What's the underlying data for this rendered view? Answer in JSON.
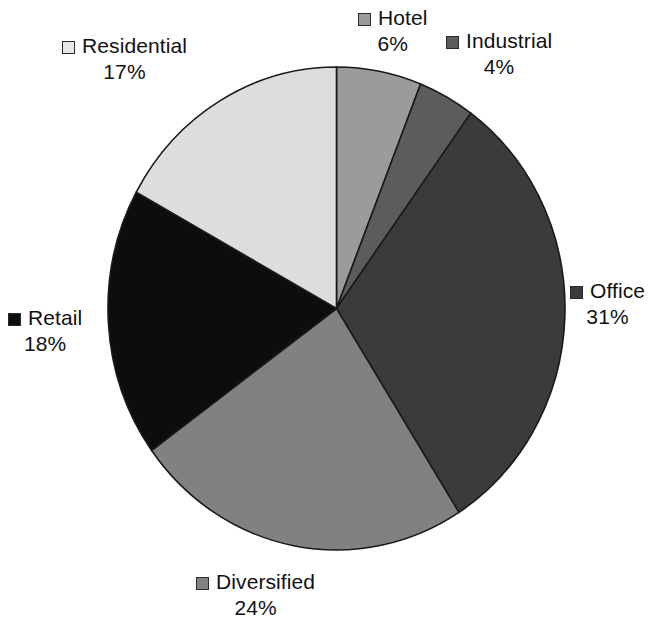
{
  "chart_data": {
    "type": "pie",
    "title": "",
    "subtitle": "",
    "xlabel": "",
    "ylabel": "",
    "grid": false,
    "legend_position": "callouts-around-pie",
    "label_format": "name + percent",
    "start_angle_deg": 0,
    "direction": "clockwise",
    "categories": [
      "Hotel",
      "Industrial",
      "Office",
      "Diversified",
      "Retail",
      "Residential"
    ],
    "values": [
      6,
      4,
      31,
      24,
      18,
      17
    ],
    "units": "percent",
    "total": 100,
    "slices": [
      {
        "name": "Hotel",
        "value": 6,
        "label": "Hotel",
        "percent_text": "6%",
        "color": "#9b9b9b",
        "swatch_color": "#9b9b9b"
      },
      {
        "name": "Industrial",
        "value": 4,
        "label": "Industrial",
        "percent_text": "4%",
        "color": "#5c5c5c",
        "swatch_color": "#5c5c5c"
      },
      {
        "name": "Office",
        "value": 31,
        "label": "Office",
        "percent_text": "31%",
        "color": "#3b3b3b",
        "swatch_color": "#3b3b3b"
      },
      {
        "name": "Diversified",
        "value": 24,
        "label": "Diversified",
        "percent_text": "24%",
        "color": "#818181",
        "swatch_color": "#818181"
      },
      {
        "name": "Retail",
        "value": 18,
        "label": "Retail",
        "percent_text": "18%",
        "color": "#0d0d0d",
        "swatch_color": "#0d0d0d"
      },
      {
        "name": "Residential",
        "value": 17,
        "label": "Residential",
        "percent_text": "17%",
        "color": "#dddddd",
        "swatch_color": "#e8e8e8"
      }
    ]
  },
  "colors": {
    "background": "#ffffff",
    "text": "#111111",
    "slice_outline": "#1a1a1a",
    "swatch_border": "#2b2b2b"
  },
  "callouts": {
    "hotel": {
      "label": "Hotel",
      "percent": "6%"
    },
    "industrial": {
      "label": "Industrial",
      "percent": "4%"
    },
    "office": {
      "label": "Office",
      "percent": "31%"
    },
    "diversified": {
      "label": "Diversified",
      "percent": "24%"
    },
    "retail": {
      "label": "Retail",
      "percent": "18%"
    },
    "residential": {
      "label": "Residential",
      "percent": "17%"
    }
  }
}
